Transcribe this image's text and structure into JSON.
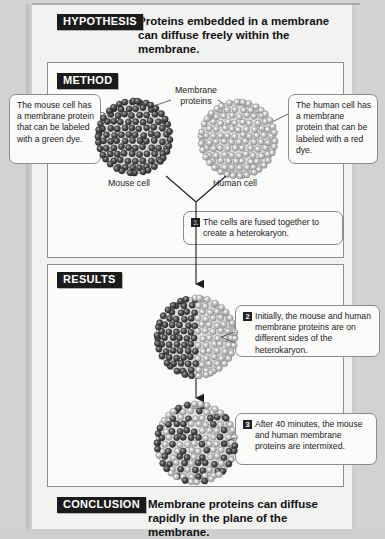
{
  "figure": {
    "type": "scientific-experiment-diagram"
  },
  "hypothesis": {
    "badge": "HYPOTHESIS",
    "text": "Proteins embedded in a membrane can diffuse freely within the membrane."
  },
  "method": {
    "badge": "METHOD",
    "label_membrane_proteins": "Membrane\nproteins",
    "label_mouse_cell": "Mouse cell",
    "label_human_cell": "Human cell",
    "callout_mouse": "The mouse cell has a membrane protein that can be labeled with a green dye.",
    "callout_human": "The human cell has a membrane protein that can be labeled with a red dye.",
    "step1_number": "1",
    "step1_text": "The cells are fused together to create a heterokaryon."
  },
  "results": {
    "badge": "RESULTS",
    "step2_number": "2",
    "step2_text": "Initially, the mouse and human membrane proteins are on different sides of the heterokaryon.",
    "step3_number": "3",
    "step3_text": "After 40 minutes, the mouse and human membrane proteins are intermixed."
  },
  "conclusion": {
    "badge": "CONCLUSION",
    "text": "Membrane proteins can diffuse rapidly in the plane of the membrane."
  },
  "colors": {
    "badge_bg": "#1b1b1b",
    "badge_fg": "#ffffff",
    "paper": "#f2f2f1",
    "page_bg": "#d2d2d2",
    "protein_dark": "#4a4a4a",
    "protein_light": "#b7b7b7",
    "cell_body": "#d9d9d9",
    "panel_border": "#8e8e8e"
  },
  "cells": [
    {
      "name": "mouse-cell",
      "protein_shade": "dark",
      "arrangement": "uniform"
    },
    {
      "name": "human-cell",
      "protein_shade": "light",
      "arrangement": "uniform"
    },
    {
      "name": "heterokaryon-initial",
      "protein_shade": "mixed",
      "arrangement": "segregated-left-dark-right-light"
    },
    {
      "name": "heterokaryon-40min",
      "protein_shade": "mixed",
      "arrangement": "intermixed"
    }
  ]
}
